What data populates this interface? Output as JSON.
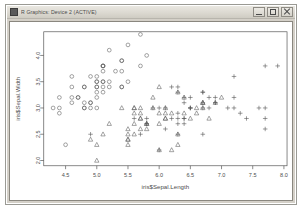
{
  "window": {
    "title": "R Graphics: Device 2 (ACTIVE)",
    "icon": "r-graphics-icon",
    "controls": [
      {
        "name": "minimize-button",
        "glyph": "minimize-icon"
      },
      {
        "name": "maximize-button",
        "glyph": "maximize-icon"
      },
      {
        "name": "close-button",
        "glyph": "close-icon"
      }
    ]
  },
  "chart_data": {
    "type": "scatter",
    "title": "",
    "xlabel": "iris$Sepal.Length",
    "ylabel": "iris$Sepal.Width",
    "xlim": [
      4.15,
      8.05
    ],
    "ylim": [
      1.9,
      4.45
    ],
    "xticks": [
      "4.5",
      "5.0",
      "5.5",
      "6.0",
      "6.5",
      "7.0",
      "7.5",
      "8.0"
    ],
    "xtickvals": [
      4.5,
      5.0,
      5.5,
      6.0,
      6.5,
      7.0,
      7.5,
      8.0
    ],
    "yticks": [
      "2.0",
      "2.5",
      "3.0",
      "3.5",
      "4.0"
    ],
    "ytickvals": [
      2.0,
      2.5,
      3.0,
      3.5,
      4.0
    ],
    "grid": false,
    "legend": "none",
    "point_color": "#555555",
    "frame_color": "#555555",
    "series": [
      {
        "name": "setosa",
        "marker": "circle",
        "points": [
          [
            5.1,
            3.5
          ],
          [
            4.9,
            3.0
          ],
          [
            4.7,
            3.2
          ],
          [
            4.6,
            3.1
          ],
          [
            5.0,
            3.6
          ],
          [
            5.4,
            3.9
          ],
          [
            4.6,
            3.4
          ],
          [
            5.0,
            3.4
          ],
          [
            4.4,
            2.9
          ],
          [
            4.9,
            3.1
          ],
          [
            5.4,
            3.7
          ],
          [
            4.8,
            3.4
          ],
          [
            4.8,
            3.0
          ],
          [
            4.3,
            3.0
          ],
          [
            5.8,
            4.0
          ],
          [
            5.7,
            4.4
          ],
          [
            5.4,
            3.9
          ],
          [
            5.1,
            3.5
          ],
          [
            5.7,
            3.8
          ],
          [
            5.1,
            3.8
          ],
          [
            5.4,
            3.4
          ],
          [
            5.1,
            3.7
          ],
          [
            4.6,
            3.6
          ],
          [
            5.1,
            3.3
          ],
          [
            4.8,
            3.4
          ],
          [
            5.0,
            3.0
          ],
          [
            5.0,
            3.4
          ],
          [
            5.2,
            3.5
          ],
          [
            5.2,
            3.4
          ],
          [
            4.7,
            3.2
          ],
          [
            4.8,
            3.1
          ],
          [
            5.4,
            3.4
          ],
          [
            5.2,
            4.1
          ],
          [
            5.5,
            4.2
          ],
          [
            4.9,
            3.1
          ],
          [
            5.0,
            3.2
          ],
          [
            5.5,
            3.5
          ],
          [
            4.9,
            3.6
          ],
          [
            4.4,
            3.0
          ],
          [
            5.1,
            3.4
          ],
          [
            5.0,
            3.5
          ],
          [
            4.5,
            2.3
          ],
          [
            4.4,
            3.2
          ],
          [
            5.0,
            3.5
          ],
          [
            5.1,
            3.8
          ],
          [
            4.8,
            3.0
          ],
          [
            5.1,
            3.8
          ],
          [
            4.6,
            3.2
          ],
          [
            5.3,
            3.7
          ],
          [
            5.0,
            3.3
          ]
        ]
      },
      {
        "name": "versicolor",
        "marker": "triangle",
        "points": [
          [
            7.0,
            3.2
          ],
          [
            6.4,
            3.2
          ],
          [
            6.9,
            3.1
          ],
          [
            5.5,
            2.3
          ],
          [
            6.5,
            2.8
          ],
          [
            5.7,
            2.8
          ],
          [
            6.3,
            3.3
          ],
          [
            4.9,
            2.4
          ],
          [
            6.6,
            2.9
          ],
          [
            5.2,
            2.7
          ],
          [
            5.0,
            2.0
          ],
          [
            5.9,
            3.0
          ],
          [
            6.0,
            2.2
          ],
          [
            6.1,
            2.9
          ],
          [
            5.6,
            2.9
          ],
          [
            6.7,
            3.1
          ],
          [
            5.6,
            3.0
          ],
          [
            5.8,
            2.7
          ],
          [
            6.2,
            2.2
          ],
          [
            5.6,
            2.5
          ],
          [
            5.9,
            3.2
          ],
          [
            6.1,
            2.8
          ],
          [
            6.3,
            2.5
          ],
          [
            6.1,
            2.8
          ],
          [
            6.4,
            2.9
          ],
          [
            6.6,
            3.0
          ],
          [
            6.8,
            2.8
          ],
          [
            6.7,
            3.0
          ],
          [
            6.0,
            2.9
          ],
          [
            5.7,
            2.6
          ],
          [
            5.5,
            2.4
          ],
          [
            5.5,
            2.4
          ],
          [
            5.8,
            2.7
          ],
          [
            6.0,
            2.7
          ],
          [
            5.4,
            3.0
          ],
          [
            6.0,
            3.4
          ],
          [
            6.7,
            3.1
          ],
          [
            6.3,
            2.3
          ],
          [
            5.6,
            3.0
          ],
          [
            5.5,
            2.5
          ],
          [
            5.5,
            2.6
          ],
          [
            6.1,
            3.0
          ],
          [
            5.8,
            2.6
          ],
          [
            5.0,
            2.3
          ],
          [
            5.6,
            2.7
          ],
          [
            5.7,
            3.0
          ],
          [
            5.7,
            2.9
          ],
          [
            6.2,
            2.9
          ],
          [
            5.1,
            2.5
          ],
          [
            5.7,
            2.8
          ]
        ]
      },
      {
        "name": "virginica",
        "marker": "plus",
        "points": [
          [
            6.3,
            3.3
          ],
          [
            5.8,
            2.7
          ],
          [
            7.1,
            3.0
          ],
          [
            6.3,
            2.9
          ],
          [
            6.5,
            3.0
          ],
          [
            7.6,
            3.0
          ],
          [
            4.9,
            2.5
          ],
          [
            7.3,
            2.9
          ],
          [
            6.7,
            2.5
          ],
          [
            7.2,
            3.6
          ],
          [
            6.5,
            3.2
          ],
          [
            6.4,
            2.7
          ],
          [
            6.8,
            3.0
          ],
          [
            5.7,
            2.5
          ],
          [
            5.8,
            2.8
          ],
          [
            6.4,
            3.2
          ],
          [
            6.5,
            3.0
          ],
          [
            7.7,
            3.8
          ],
          [
            7.7,
            2.6
          ],
          [
            6.0,
            2.2
          ],
          [
            6.9,
            3.2
          ],
          [
            5.6,
            2.8
          ],
          [
            7.7,
            2.8
          ],
          [
            6.3,
            2.7
          ],
          [
            6.7,
            3.3
          ],
          [
            7.2,
            3.2
          ],
          [
            6.2,
            2.8
          ],
          [
            6.1,
            3.0
          ],
          [
            6.4,
            2.8
          ],
          [
            7.2,
            3.0
          ],
          [
            7.4,
            2.8
          ],
          [
            7.9,
            3.8
          ],
          [
            6.4,
            2.8
          ],
          [
            6.3,
            2.8
          ],
          [
            6.1,
            2.6
          ],
          [
            7.7,
            3.0
          ],
          [
            6.3,
            3.4
          ],
          [
            6.4,
            3.1
          ],
          [
            6.0,
            3.0
          ],
          [
            6.9,
            3.1
          ],
          [
            6.7,
            3.1
          ],
          [
            6.9,
            3.1
          ],
          [
            5.8,
            2.7
          ],
          [
            6.8,
            3.2
          ],
          [
            6.7,
            3.3
          ],
          [
            6.7,
            3.0
          ],
          [
            6.3,
            2.5
          ],
          [
            6.5,
            3.0
          ],
          [
            6.2,
            3.4
          ],
          [
            5.9,
            3.0
          ]
        ]
      }
    ]
  }
}
